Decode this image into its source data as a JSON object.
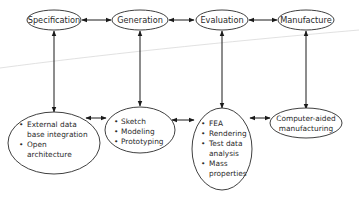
{
  "diagram": {
    "top_nodes": [
      {
        "id": "specification",
        "label": "Specification"
      },
      {
        "id": "generation",
        "label": "Generation"
      },
      {
        "id": "evaluation",
        "label": "Evaluation"
      },
      {
        "id": "manufacture",
        "label": "Manufacture"
      }
    ],
    "bottom_nodes": [
      {
        "id": "specification-detail",
        "lines": [
          "External data",
          "base integration",
          "Open",
          "architecture"
        ],
        "bullets": [
          "External data base integration",
          "Open architecture"
        ]
      },
      {
        "id": "generation-detail",
        "lines": [
          "Sketch",
          "Modeling",
          "Prototyping"
        ],
        "bullets": [
          "Sketch",
          "Modeling",
          "Prototyping"
        ]
      },
      {
        "id": "evaluation-detail",
        "lines": [
          "FEA",
          "Rendering",
          "Test data",
          "analysis",
          "Mass",
          "properties"
        ],
        "bullets": [
          "FEA",
          "Rendering",
          "Test data analysis",
          "Mass properties"
        ]
      },
      {
        "id": "manufacture-detail",
        "lines": [
          "Computer-aided",
          "manufacturing"
        ],
        "bullets": []
      }
    ],
    "edges": [
      {
        "from": "Specification",
        "to": "Generation",
        "type": "bidirectional"
      },
      {
        "from": "Generation",
        "to": "Evaluation",
        "type": "bidirectional"
      },
      {
        "from": "Evaluation",
        "to": "Manufacture",
        "type": "bidirectional"
      },
      {
        "from": "Specification",
        "to": "specification-detail",
        "type": "bidirectional"
      },
      {
        "from": "Generation",
        "to": "generation-detail",
        "type": "bidirectional"
      },
      {
        "from": "Evaluation",
        "to": "evaluation-detail",
        "type": "bidirectional"
      },
      {
        "from": "Manufacture",
        "to": "manufacture-detail",
        "type": "bidirectional"
      },
      {
        "from": "specification-detail",
        "to": "generation-detail",
        "type": "bidirectional"
      },
      {
        "from": "generation-detail",
        "to": "evaluation-detail",
        "type": "bidirectional"
      },
      {
        "from": "evaluation-detail",
        "to": "manufacture-detail",
        "type": "bidirectional"
      }
    ],
    "bullet_glyph": "•"
  }
}
